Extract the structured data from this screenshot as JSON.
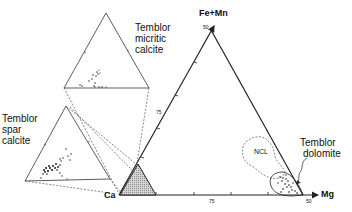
{
  "diagram": {
    "type": "ternary",
    "vertices": {
      "top": "Fe+Mn",
      "bottom_left": "Ca",
      "bottom_right": "Mg"
    },
    "ticks": {
      "apex": "50",
      "left_edge": "75",
      "base_mid": "75",
      "base_right": "50"
    },
    "regions": [
      {
        "id": "micritic",
        "lines": [
          "Temblor",
          "micritic",
          "calcite"
        ]
      },
      {
        "id": "spar",
        "lines": [
          "Temblor",
          "spar",
          "calcite"
        ]
      },
      {
        "id": "dolomite",
        "lines": [
          "Temblor",
          "dolomite"
        ]
      },
      {
        "id": "ncl",
        "label": "NCL"
      }
    ],
    "colors": {
      "line": "#222222",
      "dashed": "#555555",
      "hatch": "#888888",
      "points": "#111111"
    }
  }
}
